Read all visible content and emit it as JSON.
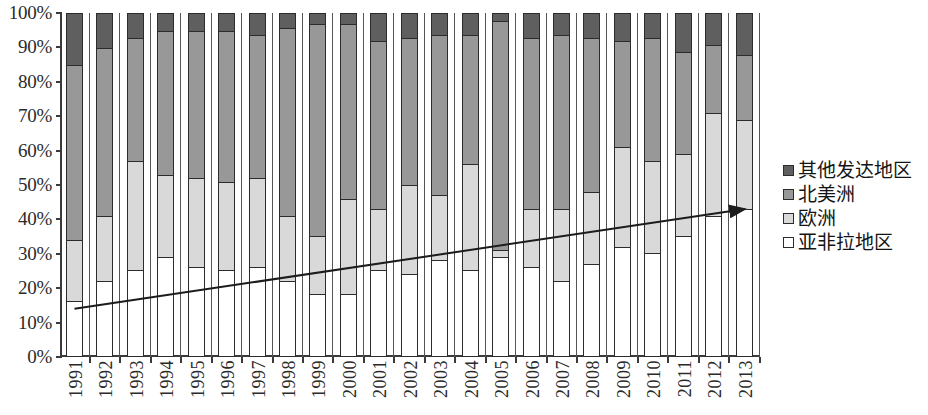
{
  "chart_data": {
    "type": "bar",
    "subtype": "stacked-percentage-column",
    "title": "",
    "xlabel": "",
    "ylabel": "",
    "ylim": [
      0,
      100
    ],
    "y_unit": "%",
    "grid": false,
    "legend_position": "right",
    "y_ticks": [
      "0%",
      "10%",
      "20%",
      "30%",
      "40%",
      "50%",
      "60%",
      "70%",
      "80%",
      "90%",
      "100%"
    ],
    "y_tick_values": [
      0,
      10,
      20,
      30,
      40,
      50,
      60,
      70,
      80,
      90,
      100
    ],
    "categories": [
      "1991",
      "1992",
      "1993",
      "1994",
      "1995",
      "1996",
      "1997",
      "1998",
      "1999",
      "2000",
      "2001",
      "2002",
      "2003",
      "2004",
      "2005",
      "2006",
      "2007",
      "2008",
      "2009",
      "2010",
      "2011",
      "2012",
      "2013"
    ],
    "series": [
      {
        "name": "亚非拉地区",
        "color": "#ffffff",
        "values": [
          16,
          22,
          25,
          29,
          26,
          25,
          26,
          22,
          18,
          18,
          25,
          24,
          28,
          25,
          29,
          26,
          22,
          27,
          32,
          30,
          35,
          41,
          43
        ]
      },
      {
        "name": "欧洲",
        "color": "#d9d9d9",
        "values": [
          18,
          19,
          32,
          24,
          26,
          26,
          26,
          19,
          17,
          28,
          18,
          26,
          19,
          31,
          2,
          17,
          21,
          21,
          29,
          27,
          24,
          30,
          26
        ]
      },
      {
        "name": "北美洲",
        "color": "#989898",
        "values": [
          51,
          49,
          36,
          42,
          43,
          44,
          42,
          55,
          62,
          51,
          49,
          43,
          47,
          38,
          67,
          50,
          51,
          45,
          31,
          36,
          30,
          20,
          19
        ]
      },
      {
        "name": "其他发达地区",
        "color": "#5f5f5f",
        "values": [
          15,
          10,
          7,
          5,
          5,
          5,
          6,
          4,
          3,
          3,
          8,
          7,
          6,
          6,
          2,
          7,
          6,
          7,
          8,
          7,
          11,
          9,
          12
        ]
      }
    ],
    "annotations": [
      {
        "type": "arrow",
        "label": "rising trend of 亚非拉地区 share",
        "start": {
          "x_category": "1991",
          "y_value": 14
        },
        "end": {
          "x_category": "2013",
          "y_value": 43
        },
        "color": "#1c1c1c"
      }
    ]
  },
  "legend": {
    "items": [
      {
        "label": "其他发达地区",
        "color": "#5f5f5f"
      },
      {
        "label": "北美洲",
        "color": "#989898"
      },
      {
        "label": "欧洲",
        "color": "#d9d9d9"
      },
      {
        "label": "亚非拉地区",
        "color": "#ffffff"
      }
    ]
  },
  "colors": {
    "other_developed": "#5f5f5f",
    "north_america": "#989898",
    "europe": "#d9d9d9",
    "asia_africa_latam": "#ffffff",
    "axis": "#3a3a3a",
    "outline": "#2c2c2c",
    "arrow": "#1c1c1c",
    "background": "#ffffff"
  }
}
